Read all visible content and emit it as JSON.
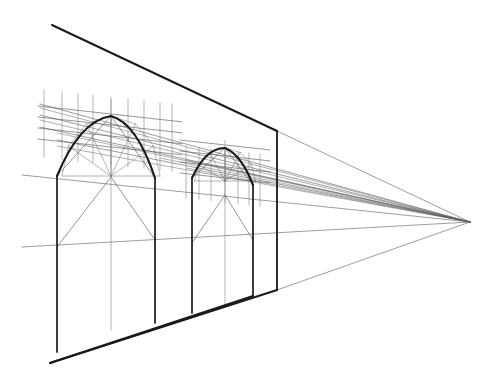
{
  "document": {
    "title": "Two-bay arcade in one-point perspective",
    "subject": "architectural perspective construction drawing",
    "medium": "line drawing, black ink on white",
    "background_color": "#ffffff",
    "ink_color": "#1a1a1a",
    "construction_color": "#5a5a5a",
    "faint_color": "#8a8a8a",
    "canvas": {
      "width": 497,
      "height": 385
    }
  },
  "chart_data": {
    "type": "diagram",
    "title": "Two-bay arcade in one-point perspective",
    "xlabel": "",
    "ylabel": "",
    "grid": false,
    "legend": "none"
  },
  "geometry": {
    "vanishing_point": {
      "x": 470,
      "y": 222,
      "label": "VP"
    },
    "wall": {
      "top_edge": {
        "x1": 52,
        "y1": 25,
        "x2": 277,
        "y2": 131
      },
      "bottom_edge": {
        "x1": 50,
        "y1": 363,
        "x2": 277,
        "y2": 290
      },
      "right_jamb": {
        "x": 277,
        "y_top": 131,
        "y_bottom": 290
      },
      "left_jamb": {
        "x": 57,
        "y_top": 176,
        "y_bottom": 352
      }
    },
    "receding_lines": [
      {
        "name": "grid-line-1",
        "x": 40,
        "y": 104
      },
      {
        "name": "grid-line-2",
        "x": 40,
        "y": 115
      },
      {
        "name": "grid-line-3",
        "x": 40,
        "y": 127
      },
      {
        "name": "grid-line-4",
        "x": 57,
        "y": 140
      },
      {
        "name": "springing-line",
        "x": 22,
        "y": 175
      },
      {
        "name": "impost-line",
        "x": 22,
        "y": 247
      },
      {
        "name": "top-edge-extension",
        "x": 277,
        "y": 131
      },
      {
        "name": "bottom-edge-extension",
        "x": 277,
        "y": 290
      }
    ],
    "pillars": [
      {
        "name": "pillar-1",
        "x": 57,
        "y_top": 176,
        "y_bottom": 352,
        "weight": "heavy"
      },
      {
        "name": "pillar-2",
        "x": 155,
        "y_top": 178,
        "y_bottom": 323,
        "weight": "heavy"
      },
      {
        "name": "pillar-3",
        "x": 192,
        "y_top": 178,
        "y_bottom": 313,
        "weight": "heavy"
      },
      {
        "name": "pillar-4",
        "x": 253,
        "y_top": 185,
        "y_bottom": 296,
        "weight": "heavy"
      },
      {
        "name": "plumb-1",
        "x": 111,
        "y_top": 100,
        "y_bottom": 330,
        "weight": "light"
      },
      {
        "name": "plumb-2",
        "x": 225,
        "y_top": 140,
        "y_bottom": 305,
        "weight": "light"
      },
      {
        "name": "plumb-3",
        "x": 277,
        "y_top": 131,
        "y_bottom": 290,
        "weight": "light"
      }
    ],
    "arches": [
      {
        "name": "arch-bay-1",
        "left_springing": {
          "x": 57,
          "y": 176
        },
        "right_springing": {
          "x": 155,
          "y": 178
        },
        "apex": {
          "x": 111,
          "y": 116
        },
        "centre": {
          "x": 111,
          "y": 176
        },
        "rise": 60,
        "span": 98
      },
      {
        "name": "arch-bay-2",
        "left_springing": {
          "x": 192,
          "y": 178
        },
        "right_springing": {
          "x": 253,
          "y": 185
        },
        "apex": {
          "x": 225,
          "y": 148
        },
        "centre": {
          "x": 225,
          "y": 181
        },
        "rise": 33,
        "span": 61
      }
    ],
    "setting_out_grid": {
      "bay_1": {
        "verticals_x": [
          44,
          62,
          78,
          93,
          111,
          128,
          144,
          160,
          172
        ],
        "vertical_span": 52,
        "horizontal_count": 4
      },
      "bay_2": {
        "verticals_x": [
          186,
          199,
          211,
          225,
          238,
          249,
          260
        ],
        "vertical_span": 40,
        "horizontal_count": 4
      }
    },
    "diagonals": {
      "bay_1": [
        {
          "x1": 57,
          "y1": 247,
          "x2": 111,
          "y2": 177
        },
        {
          "x1": 111,
          "y1": 177,
          "x2": 155,
          "y2": 240
        },
        {
          "x1": 57,
          "y1": 176,
          "x2": 111,
          "y2": 116
        },
        {
          "x1": 111,
          "y1": 116,
          "x2": 155,
          "y2": 178
        }
      ],
      "bay_2": [
        {
          "x1": 192,
          "y1": 243,
          "x2": 225,
          "y2": 195
        },
        {
          "x1": 225,
          "y1": 195,
          "x2": 253,
          "y2": 240
        },
        {
          "x1": 192,
          "y1": 178,
          "x2": 225,
          "y2": 148
        },
        {
          "x1": 225,
          "y1": 148,
          "x2": 253,
          "y2": 185
        }
      ]
    }
  },
  "annotations": {
    "visible_text": [],
    "labels_present": false
  }
}
